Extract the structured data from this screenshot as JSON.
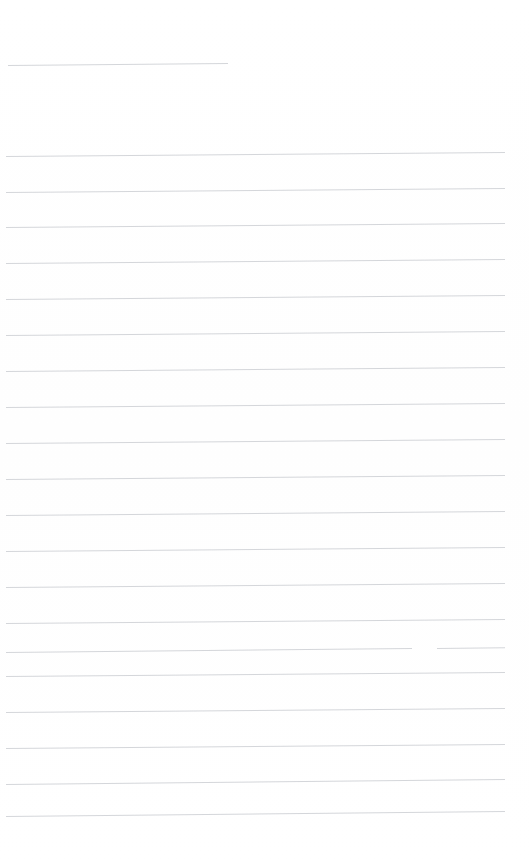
{
  "document": {
    "type": "scanned-ruled-notebook-page",
    "title": "",
    "page_width": 529,
    "page_height": 867,
    "background_color": "#ffffff",
    "rule_color": "#d2d4d8",
    "rule_thickness_px": 1,
    "rule_spacing_px": 36,
    "content_text": "",
    "handwriting_present": "none",
    "typed_text_present": "none"
  },
  "regions": {
    "header_blank_label": "",
    "body_blank_label": "",
    "footer_blank_label": ""
  },
  "rules": [
    {
      "id": "rule-header",
      "y": 65,
      "x_start": 8,
      "x_end": 228,
      "slant_px": -2,
      "kind": "short",
      "gap": null
    },
    {
      "id": "rule-1",
      "y": 156,
      "x_start": 6,
      "x_end": 505,
      "slant_px": -4,
      "kind": "full",
      "gap": null
    },
    {
      "id": "rule-2",
      "y": 192,
      "x_start": 6,
      "x_end": 505,
      "slant_px": -4,
      "kind": "full",
      "gap": null
    },
    {
      "id": "rule-3",
      "y": 227,
      "x_start": 6,
      "x_end": 505,
      "slant_px": -4,
      "kind": "full",
      "gap": null
    },
    {
      "id": "rule-4",
      "y": 263,
      "x_start": 6,
      "x_end": 505,
      "slant_px": -4,
      "kind": "full",
      "gap": null
    },
    {
      "id": "rule-5",
      "y": 299,
      "x_start": 6,
      "x_end": 505,
      "slant_px": -4,
      "kind": "full",
      "gap": null
    },
    {
      "id": "rule-6",
      "y": 335,
      "x_start": 6,
      "x_end": 505,
      "slant_px": -4,
      "kind": "full",
      "gap": null
    },
    {
      "id": "rule-7",
      "y": 371,
      "x_start": 6,
      "x_end": 505,
      "slant_px": -4,
      "kind": "full",
      "gap": null
    },
    {
      "id": "rule-8",
      "y": 407,
      "x_start": 6,
      "x_end": 505,
      "slant_px": -4,
      "kind": "full",
      "gap": null
    },
    {
      "id": "rule-9",
      "y": 443,
      "x_start": 6,
      "x_end": 505,
      "slant_px": -4,
      "kind": "full",
      "gap": null
    },
    {
      "id": "rule-10",
      "y": 479,
      "x_start": 6,
      "x_end": 505,
      "slant_px": -4,
      "kind": "full",
      "gap": null
    },
    {
      "id": "rule-11",
      "y": 515,
      "x_start": 6,
      "x_end": 505,
      "slant_px": -4,
      "kind": "full",
      "gap": null
    },
    {
      "id": "rule-12",
      "y": 551,
      "x_start": 6,
      "x_end": 505,
      "slant_px": -4,
      "kind": "full",
      "gap": null
    },
    {
      "id": "rule-13",
      "y": 587,
      "x_start": 6,
      "x_end": 505,
      "slant_px": -4,
      "kind": "full",
      "gap": null
    },
    {
      "id": "rule-14",
      "y": 623,
      "x_start": 6,
      "x_end": 505,
      "slant_px": -4,
      "kind": "full",
      "gap": null
    },
    {
      "id": "rule-15",
      "y": 652,
      "x_start": 6,
      "x_end": 505,
      "slant_px": -5,
      "kind": "full",
      "gap": {
        "x_start": 412,
        "x_end": 437
      }
    },
    {
      "id": "rule-16",
      "y": 676,
      "x_start": 6,
      "x_end": 505,
      "slant_px": -4,
      "kind": "full",
      "gap": null
    },
    {
      "id": "rule-17",
      "y": 712,
      "x_start": 6,
      "x_end": 505,
      "slant_px": -4,
      "kind": "full",
      "gap": null
    },
    {
      "id": "rule-18",
      "y": 748,
      "x_start": 6,
      "x_end": 505,
      "slant_px": -4,
      "kind": "full",
      "gap": null
    },
    {
      "id": "rule-19",
      "y": 784,
      "x_start": 6,
      "x_end": 505,
      "slant_px": -5,
      "kind": "full",
      "gap": null
    },
    {
      "id": "rule-20",
      "y": 816,
      "x_start": 6,
      "x_end": 505,
      "slant_px": -5,
      "kind": "full",
      "gap": null
    }
  ]
}
